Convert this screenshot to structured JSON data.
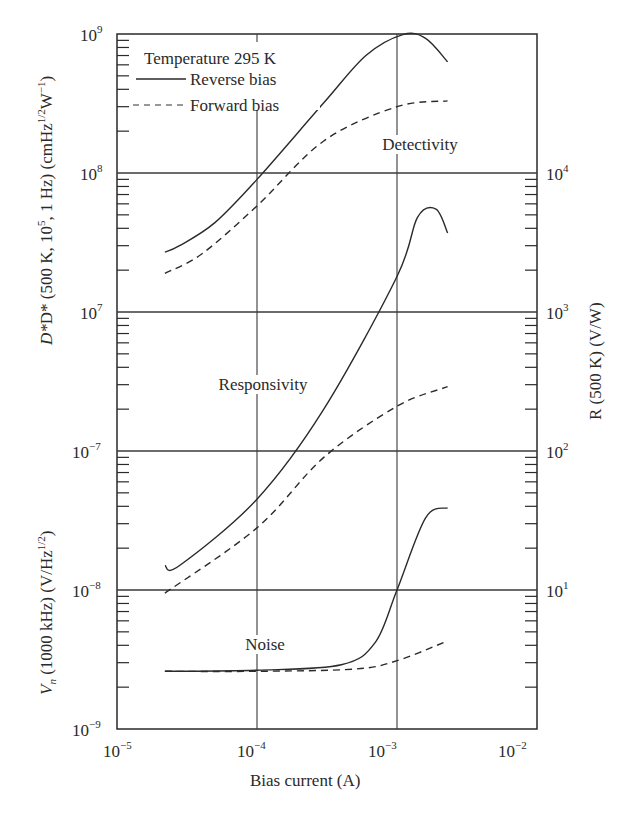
{
  "chart_data": {
    "type": "line",
    "title": "",
    "xlabel": "Bias current (A)",
    "xscale": "log",
    "xlim": [
      1e-05,
      0.01
    ],
    "x_ticks": [
      {
        "value": 1e-05,
        "base": "10",
        "exp": "−5"
      },
      {
        "value": 0.0001,
        "base": "10",
        "exp": "−4"
      },
      {
        "value": 0.001,
        "base": "10",
        "exp": "−3"
      },
      {
        "value": 0.01,
        "base": "10",
        "exp": "−2"
      }
    ],
    "left_axis_upper": {
      "label_main": "D* (500 K, 10",
      "label_exp1": "5",
      "label_mid": ", 1 Hz) (cmHz",
      "label_exp2": "1/2",
      "label_mid2": "W",
      "label_exp3": "−1",
      "label_end": ")",
      "scale": "log",
      "range": [
        10000000.0,
        1000000000.0
      ],
      "ticks": [
        {
          "value": 1000000000.0,
          "base": "10",
          "exp": "9"
        },
        {
          "value": 100000000.0,
          "base": "10",
          "exp": "8"
        },
        {
          "value": 10000000.0,
          "base": "10",
          "exp": "7"
        }
      ]
    },
    "left_axis_lower": {
      "label_prefix": "V",
      "label_sub": "n",
      "label_main": " (1000 kHz) (V/Hz",
      "label_exp": "1/2",
      "label_end": ")",
      "scale": "log",
      "range": [
        1e-09,
        1e-07
      ],
      "ticks": [
        {
          "value": 1e-07,
          "base": "10",
          "exp": "−7"
        },
        {
          "value": 1e-08,
          "base": "10",
          "exp": "−8"
        },
        {
          "value": 1e-09,
          "base": "10",
          "exp": "−9"
        }
      ]
    },
    "right_axis": {
      "label": "R (500 K) (V/W)",
      "scale": "log",
      "range": [
        1.0,
        10000.0
      ],
      "ticks": [
        {
          "value": 10000.0,
          "base": "10",
          "exp": "4"
        },
        {
          "value": 1000.0,
          "base": "10",
          "exp": "3"
        },
        {
          "value": 100.0,
          "base": "10",
          "exp": "2"
        },
        {
          "value": 10.0,
          "base": "10",
          "exp": "1"
        }
      ]
    },
    "legend": {
      "title": "Temperature 295 K",
      "entries": [
        {
          "label": "Reverse bias",
          "style": "solid"
        },
        {
          "label": "Forward bias",
          "style": "dashed"
        }
      ],
      "position": "upper-left"
    },
    "annotations": [
      {
        "text": "Detectivity",
        "x_px": 420,
        "y_px": 150
      },
      {
        "text": "Responsivity",
        "x_px": 263,
        "y_px": 390
      },
      {
        "text": "Noise",
        "x_px": 265,
        "y_px": 650
      }
    ],
    "grid": {
      "major_x": true,
      "major_y": true
    },
    "groups": [
      {
        "name": "Detectivity",
        "axis": "left_upper",
        "unit": "cmHz^1/2 W^-1",
        "series": [
          {
            "name": "Reverse bias",
            "style": "solid",
            "x": [
              2.2e-05,
              2.8e-05,
              5e-05,
              0.0001,
              0.0003,
              0.0006,
              0.0011,
              0.0016,
              0.0023
            ],
            "y": [
              27000000.0,
              30000000.0,
              44000000.0,
              90000000.0,
              320000000.0,
              700000000.0,
              990000000.0,
              930000000.0,
              630000000.0
            ]
          },
          {
            "name": "Forward bias",
            "style": "dashed",
            "x": [
              2.2e-05,
              4e-05,
              0.0001,
              0.0003,
              0.001,
              0.0023
            ],
            "y": [
              19000000.0,
              26000000.0,
              58000000.0,
              170000000.0,
              300000000.0,
              330000000.0
            ]
          }
        ]
      },
      {
        "name": "Responsivity",
        "axis": "right",
        "unit": "V/W",
        "series": [
          {
            "name": "Reverse bias",
            "style": "solid",
            "x": [
              2.2e-05,
              2.8e-05,
              0.0001,
              0.0003,
              0.001,
              0.0014,
              0.0019,
              0.0023
            ],
            "y": [
              15,
              15,
              45,
              200,
              1800,
              4800,
              5500,
              3700
            ]
          },
          {
            "name": "Forward bias",
            "style": "dashed",
            "x": [
              2.2e-05,
              0.0001,
              0.0003,
              0.001,
              0.0023
            ],
            "y": [
              9.5,
              28,
              90,
              210,
              290
            ]
          }
        ]
      },
      {
        "name": "Noise",
        "axis": "left_lower",
        "unit": "V/Hz^1/2",
        "series": [
          {
            "name": "Reverse bias",
            "style": "solid",
            "x": [
              2.2e-05,
              0.0001,
              0.0004,
              0.0007,
              0.001,
              0.0016,
              0.0023
            ],
            "y": [
              2.6e-09,
              2.65e-09,
              2.9e-09,
              4.2e-09,
              1e-08,
              3.3e-08,
              3.9e-08
            ]
          },
          {
            "name": "Forward bias",
            "style": "dashed",
            "x": [
              2.2e-05,
              0.0001,
              0.0005,
              0.001,
              0.0023
            ],
            "y": [
              2.6e-09,
              2.6e-09,
              2.7e-09,
              3.1e-09,
              4.3e-09
            ]
          }
        ]
      }
    ]
  },
  "colors": {
    "ink": "#2a2a2a",
    "grid": "#3a3a3a",
    "background": "#ffffff"
  }
}
